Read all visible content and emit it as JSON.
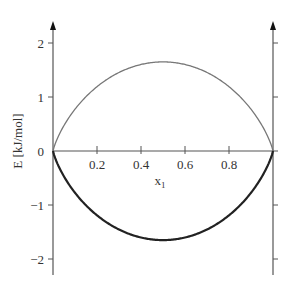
{
  "chart_data": {
    "type": "line",
    "title": "",
    "xlabel": "x",
    "xlabel_subscript": "1",
    "ylabel": "E [kJ/mol]",
    "xlim": [
      0,
      1
    ],
    "ylim": [
      -2.3,
      2.4
    ],
    "x_ticks": [
      0.2,
      0.4,
      0.6,
      0.8
    ],
    "x_tick_labels": [
      "0.2",
      "0.4",
      "0.6",
      "0.8"
    ],
    "y_ticks": [
      2,
      1,
      0,
      -1,
      -2
    ],
    "y_tick_labels": [
      "2",
      "1",
      "0",
      "-1",
      "-2"
    ],
    "grid": false,
    "legend": null,
    "series": [
      {
        "name": "upper curve (-TΔS_mix)",
        "color": "#777777",
        "x": [
          0,
          0.05,
          0.1,
          0.2,
          0.3,
          0.4,
          0.5,
          0.6,
          0.7,
          0.8,
          0.9,
          0.95,
          1
        ],
        "values": [
          0,
          0.47,
          0.77,
          1.19,
          1.45,
          1.6,
          1.65,
          1.6,
          1.45,
          1.19,
          0.77,
          0.47,
          0
        ]
      },
      {
        "name": "lower curve (ΔG_mix)",
        "color": "#222222",
        "x": [
          0,
          0.05,
          0.1,
          0.2,
          0.3,
          0.4,
          0.5,
          0.6,
          0.7,
          0.8,
          0.9,
          0.95,
          1
        ],
        "values": [
          0,
          -0.47,
          -0.77,
          -1.19,
          -1.45,
          -1.6,
          -1.65,
          -1.6,
          -1.45,
          -1.19,
          -0.77,
          -0.47,
          0
        ]
      }
    ]
  },
  "colors": {
    "axis": "#555555",
    "upper_curve": "#777777",
    "lower_curve": "#222222"
  }
}
